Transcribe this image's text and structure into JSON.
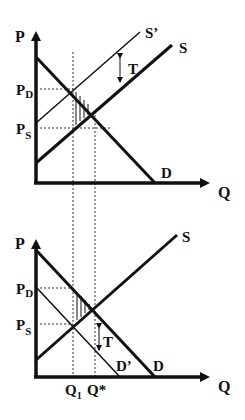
{
  "diagram": {
    "colors": {
      "ink": "#111111",
      "background": "#ffffff"
    },
    "top_panel": {
      "axis_y_label": "P",
      "axis_x_label": "Q",
      "curves": {
        "demand": "D",
        "supply": "S",
        "supply_shifted": "S’"
      },
      "price_labels": {
        "buyer_price_main": "P",
        "buyer_price_sub": "D",
        "seller_price_main": "P",
        "seller_price_sub": "S"
      },
      "tax_label": "T"
    },
    "bottom_panel": {
      "axis_y_label": "P",
      "axis_x_label": "Q",
      "curves": {
        "demand": "D",
        "demand_shifted": "D’",
        "supply": "S"
      },
      "price_labels": {
        "buyer_price_main": "P",
        "buyer_price_sub": "D",
        "seller_price_main": "P",
        "seller_price_sub": "S"
      },
      "quantity_labels": {
        "q1_main": "Q",
        "q1_sub": "1",
        "q_star": "Q*"
      },
      "tax_label": "T"
    }
  }
}
